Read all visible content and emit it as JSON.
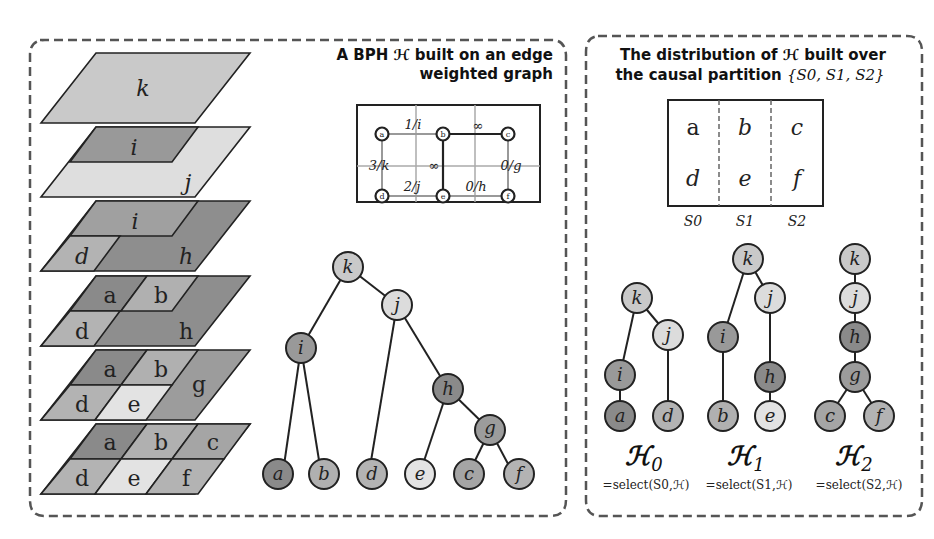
{
  "left_panel": {
    "title_line1": "A BPH ℋ built on an edge",
    "title_line2": "weighted graph",
    "layers": [
      {
        "regions": [
          "k"
        ]
      },
      {
        "regions": [
          "i",
          "j"
        ]
      },
      {
        "regions": [
          "i",
          "d",
          "h"
        ]
      },
      {
        "regions": [
          "a",
          "b",
          "d",
          "h"
        ]
      },
      {
        "regions": [
          "a",
          "b",
          "d",
          "e",
          "g"
        ]
      },
      {
        "regions": [
          "a",
          "b",
          "c",
          "d",
          "e",
          "f"
        ]
      }
    ],
    "graph": {
      "nodes": [
        "a",
        "b",
        "c",
        "d",
        "e",
        "f"
      ],
      "edge_labels": {
        "ab": "1/i",
        "bc": "∞",
        "ad": "3/k",
        "be": "∞",
        "cf": "0/g",
        "de": "2/j",
        "ef": "0/h"
      }
    },
    "tree": {
      "nodes": [
        "k",
        "j",
        "i",
        "h",
        "g",
        "a",
        "b",
        "d",
        "e",
        "c",
        "f"
      ]
    }
  },
  "right_panel": {
    "title_line1": "The distribution of ℋ built over",
    "title_line2_prefix": "the causal partition ",
    "title_line2_set": "{S0, S1, S2}",
    "partition_table": {
      "rows": [
        [
          "a",
          "b",
          "c"
        ],
        [
          "d",
          "e",
          "f"
        ]
      ],
      "columns": [
        "S0",
        "S1",
        "S2"
      ]
    },
    "subtrees": [
      {
        "name": "ℋ",
        "sub": "0",
        "caption": "=select(S0,ℋ)"
      },
      {
        "name": "ℋ",
        "sub": "1",
        "caption": "=select(S1,ℋ)"
      },
      {
        "name": "ℋ",
        "sub": "2",
        "caption": "=select(S2,ℋ)"
      }
    ]
  },
  "colors": {
    "dark": "#8f8f8f",
    "mid": "#adadad",
    "light": "#c8c8c8",
    "lighter": "#e2e2e2",
    "k_fill": "#c9c9c9",
    "j_fill": "#dcdcdc",
    "stroke": "#222222",
    "dash": "#555555"
  }
}
